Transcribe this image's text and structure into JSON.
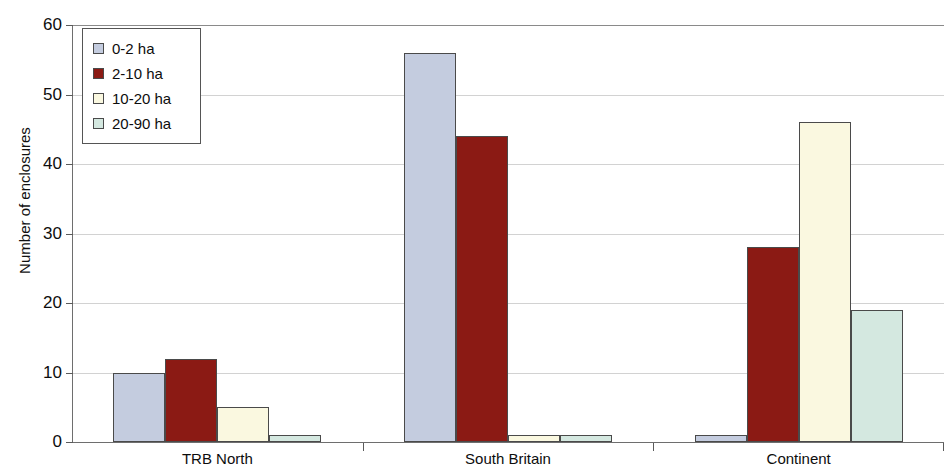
{
  "chart_data": {
    "type": "bar",
    "title": "",
    "subtitle": "",
    "xlabel": "",
    "ylabel": "Number of enclosures",
    "ylim": [
      0,
      60
    ],
    "ytick_step": 10,
    "ytick_labels": [
      "60",
      "50",
      "40",
      "30",
      "20",
      "10",
      "0"
    ],
    "ytick_values": [
      60,
      50,
      40,
      30,
      20,
      10,
      0
    ],
    "grid": true,
    "grid_axis": "y",
    "categories": [
      "TRB North",
      "South Britain",
      "Continent"
    ],
    "legend_position": "top-left-inside",
    "series": [
      {
        "name": "0-2 ha",
        "color": "#c4ccdf",
        "values": [
          10,
          56,
          1
        ]
      },
      {
        "name": "2-10 ha",
        "color": "#8b1a14",
        "values": [
          12,
          44,
          28
        ]
      },
      {
        "name": "10-20 ha",
        "color": "#faf8e0",
        "values": [
          5,
          1,
          46
        ]
      },
      {
        "name": "20-90 ha",
        "color": "#d4e8e0",
        "values": [
          1,
          1,
          19
        ]
      }
    ],
    "colors": {
      "bar_outline": "#4a4a4a",
      "gridline": "#d2d2d2",
      "axis": "#6e6e6e",
      "text": "#0d0d0d",
      "background": "#ffffff"
    }
  },
  "legend": {
    "items": [
      {
        "label": "0-2 ha"
      },
      {
        "label": "2-10 ha"
      },
      {
        "label": "10-20 ha"
      },
      {
        "label": "20-90 ha"
      }
    ]
  },
  "axes": {
    "y_title": "Number of enclosures"
  }
}
